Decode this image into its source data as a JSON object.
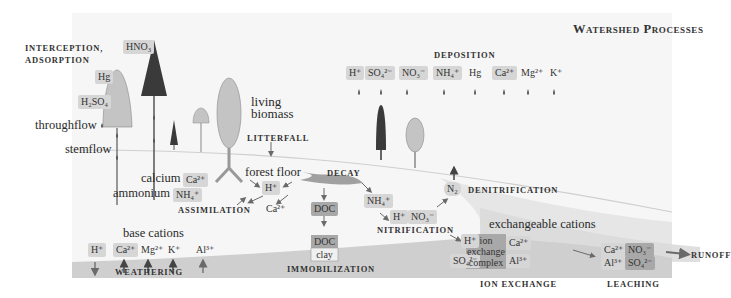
{
  "title": "Watershed Processes",
  "colors": {
    "background_panel": "#f6f6f6",
    "soil_band": "#cfcfcf",
    "chip_light": "#d6d6d6",
    "chip_dark": "#a8a8a8",
    "tree_dark": "#3a3a3a",
    "tree_light": "#c4c4c4",
    "arrow": "#6a6a6a"
  },
  "left_labels": {
    "interception": "INTERCEPTION,",
    "adsorption": "ADSORPTION",
    "throughflow": "throughflow",
    "stemflow": "stemflow"
  },
  "canopy_chips": {
    "hno3": "HNO₃",
    "hg": "Hg",
    "h2so4": "H₂SO₄"
  },
  "biomass": {
    "line1": "living",
    "line2": "biomass",
    "litterfall": "LITTERFALL",
    "forest_floor": "forest floor",
    "decay": "DECAY"
  },
  "deposition": {
    "label": "DEPOSITION",
    "ions": [
      "H⁺",
      "SO₄²⁻",
      "NO₃⁻",
      "NH₄⁺",
      "Hg",
      "Ca²⁺",
      "Mg²⁺",
      "K⁺"
    ]
  },
  "assimilation": {
    "calcium_label": "calcium",
    "calcium_ion": "Ca²⁺",
    "ammonium_label": "ammonium",
    "ammonium_ion": "NH₄⁺",
    "label": "ASSIMILATION"
  },
  "forest_floor_ions": {
    "h": "H⁺",
    "ca": "Ca²⁺",
    "doc": "DOC"
  },
  "immobilization": {
    "doc": "DOC",
    "clay": "clay",
    "label": "IMMOBILIZATION"
  },
  "weathering": {
    "base_cations_label": "base cations",
    "ions": [
      "H⁺",
      "Ca²⁺",
      "Mg²⁺",
      "K⁺",
      "Al³⁺"
    ],
    "label": "WEATHERING"
  },
  "nitrification": {
    "nh4": "NH₄⁺",
    "h": "H⁺",
    "no3": "NO₃⁻",
    "label": "NITRIFICATION"
  },
  "denitrification": {
    "n2": "N₂",
    "label": "DENITRIFICATION"
  },
  "ion_exchange": {
    "exchangeable_label": "exchangeable cations",
    "h": "H⁺",
    "so4": "SO₄²⁻",
    "complex_line1": "ion",
    "complex_line2": "exchange",
    "complex_line3": "complex",
    "ca": "Ca²⁺",
    "al": "Al³⁺",
    "label": "ION EXCHANGE"
  },
  "leaching": {
    "ca": "Ca²⁺",
    "no3": "NO₃⁻",
    "al": "Al³⁺",
    "so4": "SO₄²⁻",
    "label": "LEACHING"
  },
  "runoff": "RUNOFF"
}
